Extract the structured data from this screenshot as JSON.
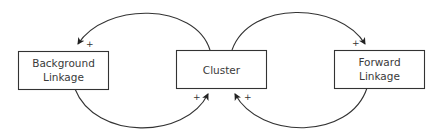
{
  "diagram": {
    "type": "causal-loop",
    "nodes": [
      {
        "id": "background",
        "lines": [
          "Background",
          "Linkage"
        ]
      },
      {
        "id": "cluster",
        "lines": [
          "Cluster"
        ]
      },
      {
        "id": "forward",
        "lines": [
          "Forward",
          "Linkage"
        ]
      }
    ],
    "edges": [
      {
        "from": "cluster",
        "to": "background",
        "polarity": "+"
      },
      {
        "from": "background",
        "to": "cluster",
        "polarity": "+"
      },
      {
        "from": "cluster",
        "to": "forward",
        "polarity": "+"
      },
      {
        "from": "forward",
        "to": "cluster",
        "polarity": "+"
      }
    ],
    "colors": {
      "stroke": "#333333",
      "text": "#3a3a3a",
      "background": "#ffffff"
    }
  }
}
